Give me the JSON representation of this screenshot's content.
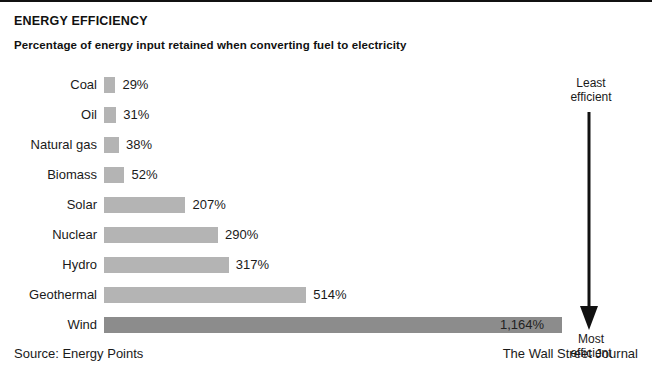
{
  "header": {
    "title": "ENERGY EFFICIENCY",
    "subtitle": "Percentage of energy input retained when converting fuel to electricity"
  },
  "annotations": {
    "top_line1": "Least",
    "top_line2": "efficient",
    "bottom_line1": "Most",
    "bottom_line2": "efficient",
    "arrow_icon": "down-arrow-icon"
  },
  "footer": {
    "source": "Source: Energy Points",
    "credit": "The Wall Street Journal"
  },
  "colors": {
    "bar": "#b4b4b4",
    "bar_highlight": "#8c8c8c",
    "text": "#1a1a1a",
    "rule": "#111111"
  },
  "chart_data": {
    "type": "bar",
    "orientation": "horizontal",
    "title": "ENERGY EFFICIENCY",
    "subtitle": "Percentage of energy input retained when converting fuel to electricity",
    "xlabel": "",
    "ylabel": "",
    "xlim": [
      0,
      1164
    ],
    "grid": false,
    "legend": false,
    "value_suffix": "%",
    "categories": [
      "Coal",
      "Oil",
      "Natural gas",
      "Biomass",
      "Solar",
      "Nuclear",
      "Hydro",
      "Geothermal",
      "Wind"
    ],
    "values": [
      29,
      31,
      38,
      52,
      207,
      290,
      317,
      514,
      1164
    ],
    "value_labels": [
      "29%",
      "31%",
      "38%",
      "52%",
      "207%",
      "290%",
      "317%",
      "514%",
      "1,164%"
    ],
    "bars": [
      {
        "label": "Coal",
        "value": 29,
        "value_label": "29%",
        "highlight": false,
        "label_inside": false
      },
      {
        "label": "Oil",
        "value": 31,
        "value_label": "31%",
        "highlight": false,
        "label_inside": false
      },
      {
        "label": "Natural gas",
        "value": 38,
        "value_label": "38%",
        "highlight": false,
        "label_inside": false
      },
      {
        "label": "Biomass",
        "value": 52,
        "value_label": "52%",
        "highlight": false,
        "label_inside": false
      },
      {
        "label": "Solar",
        "value": 207,
        "value_label": "207%",
        "highlight": false,
        "label_inside": false
      },
      {
        "label": "Nuclear",
        "value": 290,
        "value_label": "290%",
        "highlight": false,
        "label_inside": false
      },
      {
        "label": "Hydro",
        "value": 317,
        "value_label": "317%",
        "highlight": false,
        "label_inside": false
      },
      {
        "label": "Geothermal",
        "value": 514,
        "value_label": "514%",
        "highlight": false,
        "label_inside": false
      },
      {
        "label": "Wind",
        "value": 1164,
        "value_label": "1,164%",
        "highlight": true,
        "label_inside": true
      }
    ],
    "annotation_axis": {
      "top": "Least efficient",
      "bottom": "Most efficient",
      "direction": "down"
    },
    "source": "Source: Energy Points",
    "credit": "The Wall Street Journal"
  }
}
